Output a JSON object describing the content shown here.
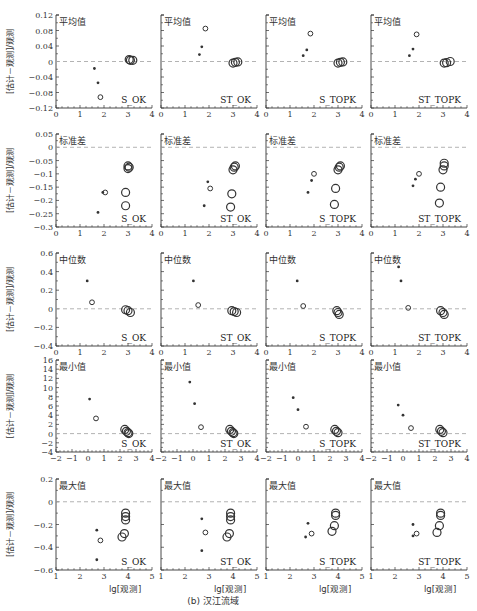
{
  "caption": "(b) 汉江流域",
  "ylabel": "[估计－观测]/观测",
  "xlabel": "lg[观测]",
  "methods": [
    "S_OK",
    "ST_OK",
    "S_TOPK",
    "ST_TOPK"
  ],
  "chart_data": [
    {
      "type": "scatter",
      "title": "平均值",
      "ylim": [
        -0.12,
        0.12
      ],
      "yticks": [
        -0.12,
        -0.08,
        -0.04,
        0,
        0.04,
        0.08,
        0.12
      ],
      "ytick_labels": [
        "−0.12",
        "−0.08",
        "−0.04",
        "0",
        "0.04",
        "0.08",
        "0.12"
      ],
      "xlim": [
        0,
        4
      ],
      "xticks": [
        0,
        1,
        2,
        3,
        4
      ],
      "reference_line": 0,
      "panels": [
        {
          "method": "S_OK",
          "points": [
            {
              "x": 1.6,
              "y": -0.018,
              "size": 1
            },
            {
              "x": 1.75,
              "y": -0.055,
              "size": 1
            },
            {
              "x": 1.85,
              "y": -0.092,
              "size": 2
            },
            {
              "x": 3.05,
              "y": 0.005,
              "size": 3
            },
            {
              "x": 3.1,
              "y": 0.003,
              "size": 3
            },
            {
              "x": 3.2,
              "y": 0.003,
              "size": 3
            }
          ]
        },
        {
          "method": "ST_OK",
          "points": [
            {
              "x": 1.6,
              "y": 0.018,
              "size": 1
            },
            {
              "x": 1.7,
              "y": 0.038,
              "size": 1
            },
            {
              "x": 1.85,
              "y": 0.085,
              "size": 2
            },
            {
              "x": 3.0,
              "y": -0.004,
              "size": 3
            },
            {
              "x": 3.1,
              "y": -0.002,
              "size": 3
            },
            {
              "x": 3.2,
              "y": -0.001,
              "size": 3
            }
          ]
        },
        {
          "method": "S_TOPK",
          "points": [
            {
              "x": 1.55,
              "y": 0.015,
              "size": 1
            },
            {
              "x": 1.7,
              "y": 0.03,
              "size": 1
            },
            {
              "x": 1.85,
              "y": 0.072,
              "size": 2
            },
            {
              "x": 3.0,
              "y": -0.004,
              "size": 3
            },
            {
              "x": 3.1,
              "y": -0.002,
              "size": 3
            },
            {
              "x": 3.2,
              "y": -0.001,
              "size": 3
            }
          ]
        },
        {
          "method": "ST_TOPK",
          "points": [
            {
              "x": 1.6,
              "y": 0.015,
              "size": 1
            },
            {
              "x": 1.75,
              "y": 0.032,
              "size": 1
            },
            {
              "x": 1.9,
              "y": 0.07,
              "size": 2
            },
            {
              "x": 3.05,
              "y": -0.004,
              "size": 3
            },
            {
              "x": 3.15,
              "y": -0.003,
              "size": 3
            },
            {
              "x": 3.3,
              "y": 0.0,
              "size": 3
            }
          ]
        }
      ]
    },
    {
      "type": "scatter",
      "title": "标准差",
      "ylim": [
        -0.3,
        0.05
      ],
      "yticks": [
        -0.3,
        -0.25,
        -0.2,
        -0.15,
        -0.1,
        -0.05,
        0,
        0.05
      ],
      "ytick_labels": [
        "−0.3",
        "−0.25",
        "−0.2",
        "−0.15",
        "−0.1",
        "−0.05",
        "0",
        "0.05"
      ],
      "xlim": [
        0,
        4
      ],
      "xticks": [
        0,
        1,
        2,
        3,
        4
      ],
      "reference_line": 0,
      "panels": [
        {
          "method": "S_OK",
          "points": [
            {
              "x": 1.75,
              "y": -0.245,
              "size": 1
            },
            {
              "x": 1.95,
              "y": -0.17,
              "size": 1
            },
            {
              "x": 2.05,
              "y": -0.17,
              "size": 2
            },
            {
              "x": 2.9,
              "y": -0.22,
              "size": 3
            },
            {
              "x": 2.9,
              "y": -0.17,
              "size": 3
            },
            {
              "x": 3.0,
              "y": -0.08,
              "size": 3
            },
            {
              "x": 3.0,
              "y": -0.07,
              "size": 3
            },
            {
              "x": 3.05,
              "y": -0.075,
              "size": 3
            }
          ]
        },
        {
          "method": "ST_OK",
          "points": [
            {
              "x": 1.8,
              "y": -0.22,
              "size": 1
            },
            {
              "x": 1.95,
              "y": -0.13,
              "size": 1
            },
            {
              "x": 2.05,
              "y": -0.155,
              "size": 2
            },
            {
              "x": 2.9,
              "y": -0.225,
              "size": 3
            },
            {
              "x": 2.95,
              "y": -0.175,
              "size": 3
            },
            {
              "x": 3.0,
              "y": -0.085,
              "size": 3
            },
            {
              "x": 3.05,
              "y": -0.075,
              "size": 3
            },
            {
              "x": 3.1,
              "y": -0.07,
              "size": 3
            }
          ]
        },
        {
          "method": "S_TOPK",
          "points": [
            {
              "x": 1.75,
              "y": -0.17,
              "size": 1
            },
            {
              "x": 1.9,
              "y": -0.125,
              "size": 1
            },
            {
              "x": 2.0,
              "y": -0.1,
              "size": 2
            },
            {
              "x": 2.85,
              "y": -0.215,
              "size": 3
            },
            {
              "x": 2.9,
              "y": -0.155,
              "size": 3
            },
            {
              "x": 3.0,
              "y": -0.085,
              "size": 3
            },
            {
              "x": 3.05,
              "y": -0.075,
              "size": 3
            },
            {
              "x": 3.1,
              "y": -0.07,
              "size": 3
            }
          ]
        },
        {
          "method": "ST_TOPK",
          "points": [
            {
              "x": 1.75,
              "y": -0.145,
              "size": 1
            },
            {
              "x": 1.85,
              "y": -0.12,
              "size": 1
            },
            {
              "x": 2.0,
              "y": -0.1,
              "size": 2
            },
            {
              "x": 2.85,
              "y": -0.21,
              "size": 3
            },
            {
              "x": 2.9,
              "y": -0.15,
              "size": 3
            },
            {
              "x": 3.0,
              "y": -0.085,
              "size": 3
            },
            {
              "x": 3.05,
              "y": -0.07,
              "size": 3
            },
            {
              "x": 3.05,
              "y": -0.06,
              "size": 3
            }
          ]
        }
      ]
    },
    {
      "type": "scatter",
      "title": "中位数",
      "ylim": [
        -0.4,
        0.6
      ],
      "yticks": [
        -0.4,
        -0.2,
        0,
        0.2,
        0.4,
        0.6
      ],
      "ytick_labels": [
        "−0.4",
        "−0.2",
        "0",
        "0.2",
        "0.4",
        "0.6"
      ],
      "xlim": [
        0,
        4
      ],
      "xticks": [
        0,
        1,
        2,
        3,
        4
      ],
      "reference_line": 0,
      "panels": [
        {
          "method": "S_OK",
          "points": [
            {
              "x": 1.3,
              "y": 0.3,
              "size": 1
            },
            {
              "x": 1.5,
              "y": 0.07,
              "size": 2
            },
            {
              "x": 2.9,
              "y": -0.01,
              "size": 3
            },
            {
              "x": 3.0,
              "y": -0.02,
              "size": 3
            },
            {
              "x": 3.1,
              "y": -0.04,
              "size": 3
            }
          ]
        },
        {
          "method": "ST_OK",
          "points": [
            {
              "x": 1.35,
              "y": 0.3,
              "size": 1
            },
            {
              "x": 1.55,
              "y": 0.04,
              "size": 2
            },
            {
              "x": 2.95,
              "y": -0.02,
              "size": 3
            },
            {
              "x": 3.05,
              "y": -0.03,
              "size": 3
            },
            {
              "x": 3.15,
              "y": -0.04,
              "size": 3
            }
          ]
        },
        {
          "method": "S_TOPK",
          "points": [
            {
              "x": 1.3,
              "y": 0.3,
              "size": 1
            },
            {
              "x": 1.55,
              "y": 0.03,
              "size": 2
            },
            {
              "x": 2.95,
              "y": -0.02,
              "size": 3
            },
            {
              "x": 3.0,
              "y": -0.04,
              "size": 3
            },
            {
              "x": 3.05,
              "y": -0.06,
              "size": 3
            }
          ]
        },
        {
          "method": "ST_TOPK",
          "points": [
            {
              "x": 1.15,
              "y": 0.45,
              "size": 1
            },
            {
              "x": 1.25,
              "y": 0.3,
              "size": 1
            },
            {
              "x": 1.55,
              "y": 0.01,
              "size": 2
            },
            {
              "x": 2.9,
              "y": -0.02,
              "size": 3
            },
            {
              "x": 3.0,
              "y": -0.04,
              "size": 3
            },
            {
              "x": 3.05,
              "y": -0.06,
              "size": 3
            }
          ]
        }
      ]
    },
    {
      "type": "scatter",
      "title": "最小值",
      "ylim": [
        -4,
        16
      ],
      "yticks": [
        -4,
        -2,
        0,
        2,
        4,
        6,
        8,
        10,
        12,
        14,
        16
      ],
      "ytick_labels": [
        "−4",
        "−2",
        "0",
        "2",
        "4",
        "6",
        "8",
        "10",
        "12",
        "14",
        "16"
      ],
      "xlim": [
        -2,
        4
      ],
      "xticks": [
        -2,
        -1,
        0,
        1,
        2,
        3,
        4
      ],
      "reference_line": 0,
      "panels": [
        {
          "method": "S_OK",
          "points": [
            {
              "x": 0.1,
              "y": 7.5,
              "size": 1
            },
            {
              "x": 0.5,
              "y": 3.3,
              "size": 2
            },
            {
              "x": 2.3,
              "y": 0.9,
              "size": 3
            },
            {
              "x": 2.4,
              "y": 0.5,
              "size": 3
            },
            {
              "x": 2.5,
              "y": 0.2,
              "size": 3
            },
            {
              "x": 2.55,
              "y": 0.0,
              "size": 3
            }
          ]
        },
        {
          "method": "ST_OK",
          "points": [
            {
              "x": -0.2,
              "y": 11.2,
              "size": 1
            },
            {
              "x": 0.1,
              "y": 6.5,
              "size": 1
            },
            {
              "x": 0.5,
              "y": 1.4,
              "size": 2
            },
            {
              "x": 2.3,
              "y": 0.9,
              "size": 3
            },
            {
              "x": 2.4,
              "y": 0.5,
              "size": 3
            },
            {
              "x": 2.5,
              "y": 0.2,
              "size": 3
            },
            {
              "x": 2.55,
              "y": 0.0,
              "size": 3
            }
          ]
        },
        {
          "method": "S_TOPK",
          "points": [
            {
              "x": -0.3,
              "y": 7.8,
              "size": 1
            },
            {
              "x": 0.0,
              "y": 5.2,
              "size": 1
            },
            {
              "x": 0.5,
              "y": 1.5,
              "size": 2
            },
            {
              "x": 2.3,
              "y": 0.9,
              "size": 3
            },
            {
              "x": 2.4,
              "y": 0.5,
              "size": 3
            },
            {
              "x": 2.5,
              "y": 0.2,
              "size": 3
            }
          ]
        },
        {
          "method": "ST_TOPK",
          "points": [
            {
              "x": -0.3,
              "y": 6.2,
              "size": 1
            },
            {
              "x": 0.0,
              "y": 4.0,
              "size": 1
            },
            {
              "x": 0.5,
              "y": 1.2,
              "size": 2
            },
            {
              "x": 2.3,
              "y": 0.9,
              "size": 3
            },
            {
              "x": 2.4,
              "y": 0.5,
              "size": 3
            },
            {
              "x": 2.5,
              "y": 0.2,
              "size": 3
            }
          ]
        }
      ]
    },
    {
      "type": "scatter",
      "title": "最大值",
      "ylim": [
        -0.6,
        0.2
      ],
      "yticks": [
        -0.6,
        -0.4,
        -0.2,
        0,
        0.2
      ],
      "ytick_labels": [
        "−0.6",
        "−0.4",
        "−0.2",
        "0",
        "0.2"
      ],
      "xlim": [
        1,
        5
      ],
      "xticks": [
        1,
        2,
        3,
        4,
        5
      ],
      "reference_line": 0,
      "panels": [
        {
          "method": "S_OK",
          "points": [
            {
              "x": 2.7,
              "y": -0.25,
              "size": 1
            },
            {
              "x": 2.7,
              "y": -0.51,
              "size": 1
            },
            {
              "x": 2.85,
              "y": -0.34,
              "size": 2
            },
            {
              "x": 3.75,
              "y": -0.31,
              "size": 3
            },
            {
              "x": 3.85,
              "y": -0.28,
              "size": 3
            },
            {
              "x": 3.9,
              "y": -0.1,
              "size": 3
            },
            {
              "x": 3.9,
              "y": -0.13,
              "size": 3
            },
            {
              "x": 3.9,
              "y": -0.16,
              "size": 3
            }
          ]
        },
        {
          "method": "ST_OK",
          "points": [
            {
              "x": 2.7,
              "y": -0.15,
              "size": 1
            },
            {
              "x": 2.7,
              "y": -0.43,
              "size": 1
            },
            {
              "x": 2.85,
              "y": -0.27,
              "size": 2
            },
            {
              "x": 3.75,
              "y": -0.31,
              "size": 3
            },
            {
              "x": 3.85,
              "y": -0.28,
              "size": 3
            },
            {
              "x": 3.9,
              "y": -0.1,
              "size": 3
            },
            {
              "x": 3.9,
              "y": -0.13,
              "size": 3
            },
            {
              "x": 3.9,
              "y": -0.16,
              "size": 3
            }
          ]
        },
        {
          "method": "S_TOPK",
          "points": [
            {
              "x": 2.65,
              "y": -0.31,
              "size": 1
            },
            {
              "x": 2.75,
              "y": -0.19,
              "size": 1
            },
            {
              "x": 2.9,
              "y": -0.28,
              "size": 2
            },
            {
              "x": 3.75,
              "y": -0.26,
              "size": 3
            },
            {
              "x": 3.85,
              "y": -0.21,
              "size": 3
            },
            {
              "x": 3.9,
              "y": -0.1,
              "size": 3
            },
            {
              "x": 3.9,
              "y": -0.12,
              "size": 3
            }
          ]
        },
        {
          "method": "ST_TOPK",
          "points": [
            {
              "x": 2.75,
              "y": -0.2,
              "size": 1
            },
            {
              "x": 2.75,
              "y": -0.3,
              "size": 1
            },
            {
              "x": 2.9,
              "y": -0.28,
              "size": 2
            },
            {
              "x": 3.75,
              "y": -0.27,
              "size": 3
            },
            {
              "x": 3.85,
              "y": -0.21,
              "size": 3
            },
            {
              "x": 3.9,
              "y": -0.1,
              "size": 3
            },
            {
              "x": 3.9,
              "y": -0.12,
              "size": 3
            }
          ]
        }
      ]
    }
  ],
  "colors": {
    "axis": "#333333",
    "reference_line": "#aaaaaa",
    "marker": "#333333",
    "text": "#2a2a2a"
  }
}
